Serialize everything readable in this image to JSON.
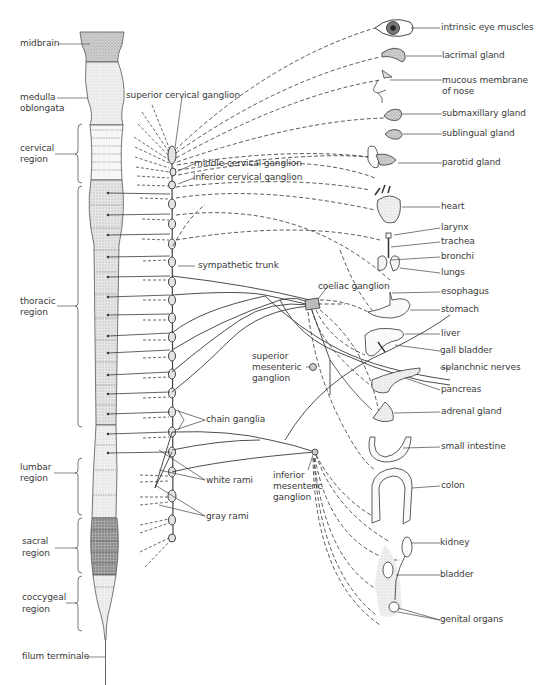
{
  "spinal_cord_labels": {
    "midbrain": "midbrain",
    "medulla": [
      "medulla",
      "oblongata"
    ],
    "cervical": [
      "cervical",
      "region"
    ],
    "thoracic": [
      "thoracic",
      "region"
    ],
    "lumbar": [
      "lumbar",
      "region"
    ],
    "sacral": [
      "sacral",
      "region"
    ],
    "coccygeal": [
      "coccygeal",
      "region"
    ],
    "filum": "filum terminale"
  },
  "ganglia_labels": {
    "superior_cervical": "superior cervical ganglion",
    "middle_cervical": "middle cervical ganglion",
    "inferior_cervical": "inferior cervical ganglion",
    "sympathetic_trunk": "sympathetic trunk",
    "coeliac": "coeliac ganglion",
    "superior_mesenteric": [
      "superior",
      "mesenteric",
      "ganglion"
    ],
    "chain_ganglia": "chain ganglia",
    "white_rami": "white rami",
    "inferior_mesenteric": [
      "inferior",
      "mesenteric",
      "ganglion"
    ],
    "gray_rami": "gray rami"
  },
  "organ_labels": [
    {
      "id": "eye",
      "text": "intrinsic eye muscles"
    },
    {
      "id": "lacrimal",
      "text": "lacrimal gland"
    },
    {
      "id": "nose",
      "text": "mucous membrane\nof nose"
    },
    {
      "id": "submaxillary",
      "text": "submaxillary gland"
    },
    {
      "id": "sublingual",
      "text": "sublingual gland"
    },
    {
      "id": "parotid",
      "text": "parotid gland"
    },
    {
      "id": "heart",
      "text": "heart"
    },
    {
      "id": "larynx",
      "text": "larynx"
    },
    {
      "id": "trachea",
      "text": "trachea"
    },
    {
      "id": "bronchi",
      "text": "bronchi"
    },
    {
      "id": "lungs",
      "text": "lungs"
    },
    {
      "id": "esophagus",
      "text": "esophagus"
    },
    {
      "id": "stomach",
      "text": "stomach"
    },
    {
      "id": "liver",
      "text": "liver"
    },
    {
      "id": "gallbladder",
      "text": "gall bladder"
    },
    {
      "id": "splanchnic",
      "text": "splanchnic nerves"
    },
    {
      "id": "pancreas",
      "text": "pancreas"
    },
    {
      "id": "adrenal",
      "text": "adrenal gland"
    },
    {
      "id": "small_intestine",
      "text": "small intestine"
    },
    {
      "id": "colon",
      "text": "colon"
    },
    {
      "id": "kidney",
      "text": "kidney"
    },
    {
      "id": "bladder",
      "text": "bladder"
    },
    {
      "id": "genital",
      "text": "genital organs"
    }
  ],
  "colors": {
    "line": "#3a3a3a",
    "stipple_light": "#d8d8d8",
    "stipple_medium": "#b8b8b8",
    "stipple_dark": "#8a8a8a"
  }
}
